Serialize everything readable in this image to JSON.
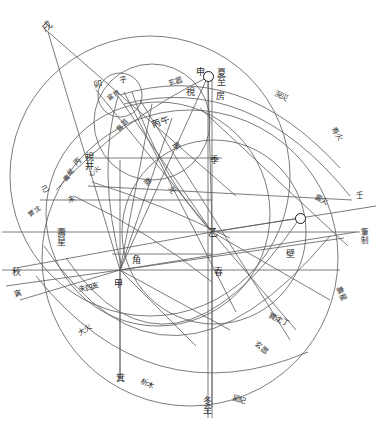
{
  "diagram": {
    "stroke_color": "#555555",
    "label_color": "#2b2b2b",
    "background": "#ffffff",
    "width": 380,
    "height": 431,
    "nodes": [
      {
        "name": "center-yi",
        "label": "乙",
        "x": 212,
        "y": 232
      },
      {
        "name": "center-jia",
        "label": "甲",
        "x": 120,
        "y": 270
      },
      {
        "name": "marker-top",
        "label": "",
        "x": 208,
        "y": 76
      },
      {
        "name": "marker-right",
        "label": "",
        "x": 300,
        "y": 218
      }
    ],
    "labels": [
      {
        "name": "label-xu",
        "text": "戌",
        "x": 42,
        "y": 22,
        "rot": -38,
        "size": "big",
        "vert": false
      },
      {
        "name": "label-mao",
        "text": "卯",
        "x": 94,
        "y": 80,
        "rot": -10,
        "size": "",
        "vert": false
      },
      {
        "name": "label-zi",
        "text": "子",
        "x": 119,
        "y": 76,
        "rot": -12,
        "size": "sm",
        "vert": false
      },
      {
        "name": "label-chunfen-inner",
        "text": "鵉首",
        "x": 107,
        "y": 92,
        "rot": -34,
        "size": "xs",
        "vert": false
      },
      {
        "name": "label-xuanxiao",
        "text": "玄嚣",
        "x": 168,
        "y": 78,
        "rot": -18,
        "size": "sm",
        "vert": false
      },
      {
        "name": "label-shen",
        "text": "申",
        "x": 196,
        "y": 68,
        "rot": 0,
        "size": "",
        "vert": false
      },
      {
        "name": "label-xiazhi",
        "text": "夏至",
        "x": 216,
        "y": 68,
        "rot": 0,
        "size": "",
        "vert": true
      },
      {
        "name": "label-shi",
        "text": "視",
        "x": 186,
        "y": 88,
        "rot": 0,
        "size": "",
        "vert": false
      },
      {
        "name": "label-fang",
        "text": "房",
        "x": 216,
        "y": 92,
        "rot": 0,
        "size": "",
        "vert": false
      },
      {
        "name": "label-chunhuo",
        "text": "淣災",
        "x": 274,
        "y": 92,
        "rot": 26,
        "size": "sm",
        "vert": false
      },
      {
        "name": "label-shouxing-r",
        "text": "寿火",
        "x": 330,
        "y": 130,
        "rot": 58,
        "size": "sm",
        "vert": false
      },
      {
        "name": "label-bingwu",
        "text": "丙午",
        "x": 152,
        "y": 118,
        "rot": -20,
        "size": "",
        "vert": false
      },
      {
        "name": "label-shunshou",
        "text": "鵉首",
        "x": 116,
        "y": 122,
        "rot": -46,
        "size": "xs",
        "vert": false
      },
      {
        "name": "label-chen",
        "text": "辰",
        "x": 172,
        "y": 142,
        "rot": 48,
        "size": "sm",
        "vert": false
      },
      {
        "name": "label-ji",
        "text": "季",
        "x": 210,
        "y": 156,
        "rot": 0,
        "size": "",
        "vert": false
      },
      {
        "name": "label-shijing",
        "text": "視井",
        "x": 84,
        "y": 152,
        "rot": 0,
        "size": "",
        "vert": true
      },
      {
        "name": "label-bing",
        "text": "丙",
        "x": 74,
        "y": 158,
        "rot": -40,
        "size": "sm",
        "vert": false
      },
      {
        "name": "label-xinhuo",
        "text": "心火",
        "x": 88,
        "y": 168,
        "rot": -42,
        "size": "xs",
        "vert": false
      },
      {
        "name": "label-chunshou",
        "text": "鵉尾",
        "x": 62,
        "y": 172,
        "rot": -48,
        "size": "xs",
        "vert": false
      },
      {
        "name": "label-dingwei",
        "text": "鼎",
        "x": 144,
        "y": 178,
        "rot": 44,
        "size": "sm",
        "vert": false
      },
      {
        "name": "label-yuan",
        "text": "元",
        "x": 168,
        "y": 186,
        "rot": 58,
        "size": "sm",
        "vert": false
      },
      {
        "name": "label-ji-left",
        "text": "己",
        "x": 42,
        "y": 186,
        "rot": -28,
        "size": "sm",
        "vert": false
      },
      {
        "name": "label-wei2",
        "text": "未",
        "x": 68,
        "y": 196,
        "rot": -24,
        "size": "sm",
        "vert": false
      },
      {
        "name": "label-shiche",
        "text": "實沈",
        "x": 28,
        "y": 208,
        "rot": -36,
        "size": "xs",
        "vert": false
      },
      {
        "name": "label-shouxing",
        "text": "壽星",
        "x": 56,
        "y": 228,
        "rot": 0,
        "size": "",
        "vert": true
      },
      {
        "name": "label-qiu",
        "text": "秋",
        "x": 12,
        "y": 268,
        "rot": 0,
        "size": "",
        "vert": false
      },
      {
        "name": "label-yin",
        "text": "寅",
        "x": 14,
        "y": 290,
        "rot": -18,
        "size": "sm",
        "vert": false
      },
      {
        "name": "label-jiao",
        "text": "角",
        "x": 132,
        "y": 256,
        "rot": 0,
        "size": "",
        "vert": false
      },
      {
        "name": "label-jia",
        "text": "甲",
        "x": 114,
        "y": 280,
        "rot": 0,
        "size": "",
        "vert": false
      },
      {
        "name": "label-wei-sihai",
        "text": "未四亥",
        "x": 78,
        "y": 284,
        "rot": -12,
        "size": "sm",
        "vert": false
      },
      {
        "name": "label-dahuo",
        "text": "大火",
        "x": 78,
        "y": 326,
        "rot": -34,
        "size": "sm",
        "vert": false
      },
      {
        "name": "label-jibox",
        "text": "箕",
        "x": 116,
        "y": 374,
        "rot": 0,
        "size": "",
        "vert": false
      },
      {
        "name": "label-ximu",
        "text": "析木",
        "x": 140,
        "y": 380,
        "rot": 24,
        "size": "sm",
        "vert": false
      },
      {
        "name": "label-yi",
        "text": "乙",
        "x": 208,
        "y": 228,
        "rot": 0,
        "size": "big",
        "vert": false
      },
      {
        "name": "label-chun",
        "text": "春",
        "x": 214,
        "y": 268,
        "rot": 0,
        "size": "",
        "vert": false
      },
      {
        "name": "label-bi",
        "text": "壁",
        "x": 286,
        "y": 250,
        "rot": 0,
        "size": "",
        "vert": false
      },
      {
        "name": "label-weiding",
        "text": "實沈丁",
        "x": 268,
        "y": 316,
        "rot": 26,
        "size": "sm",
        "vert": false
      },
      {
        "name": "label-xuanxiao-b",
        "text": "玄嚣",
        "x": 254,
        "y": 344,
        "rot": 36,
        "size": "sm",
        "vert": false
      },
      {
        "name": "label-dongzhi",
        "text": "冬至",
        "x": 202,
        "y": 396,
        "rot": 0,
        "size": "",
        "vert": true
      },
      {
        "name": "label-xingji",
        "text": "星紀",
        "x": 232,
        "y": 396,
        "rot": 14,
        "size": "sm",
        "vert": false
      },
      {
        "name": "label-ren",
        "text": "壬",
        "x": 356,
        "y": 192,
        "rot": 0,
        "size": "sm",
        "vert": false
      },
      {
        "name": "label-bizhi",
        "text": "筆制",
        "x": 360,
        "y": 228,
        "rot": 0,
        "size": "sm",
        "vert": true
      },
      {
        "name": "label-shouxing-b",
        "text": "壽星",
        "x": 334,
        "y": 290,
        "rot": 64,
        "size": "sm",
        "vert": false
      },
      {
        "name": "label-chunhuo-b",
        "text": "鵉火",
        "x": 314,
        "y": 196,
        "rot": 22,
        "size": "sm",
        "vert": false
      }
    ],
    "circles": [
      {
        "name": "outer-large-circle",
        "cx": 160,
        "cy": 190,
        "r": 168
      },
      {
        "name": "lower-large-circle",
        "cx": 186,
        "cy": 250,
        "r": 168
      },
      {
        "name": "mid-circle",
        "cx": 174,
        "cy": 228,
        "r": 112
      },
      {
        "name": "inner-right-circle",
        "cx": 212,
        "cy": 240,
        "r": 92
      },
      {
        "name": "small-upper-circle",
        "cx": 150,
        "cy": 120,
        "r": 58
      },
      {
        "name": "tiny-circle",
        "cx": 118,
        "cy": 92,
        "r": 22
      }
    ],
    "rays": [
      {
        "name": "ray-yi-to-xiazhi"
      },
      {
        "name": "ray-yi-to-dongzhi"
      },
      {
        "name": "ray-yi-to-ren"
      },
      {
        "name": "ray-yi-to-qiu"
      },
      {
        "name": "ray-jia-to-chen"
      },
      {
        "name": "ray-jia-to-yin"
      },
      {
        "name": "ray-jia-to-xu"
      }
    ]
  }
}
